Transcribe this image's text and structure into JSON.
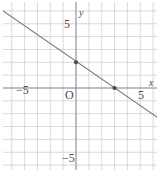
{
  "chart_data": {
    "type": "line",
    "title": "",
    "xlabel": "x",
    "ylabel": "y",
    "xlim": [
      -6,
      6.4
    ],
    "ylim": [
      -6.4,
      6.4
    ],
    "grid": true,
    "grid_step": 1,
    "legend": "none",
    "origin_label": "O",
    "x_tick_labels": [
      {
        "value": -5,
        "text": "−5"
      },
      {
        "value": 5,
        "text": "5"
      }
    ],
    "y_tick_labels": [
      {
        "value": 5,
        "text": "5"
      },
      {
        "value": -5,
        "text": "−5"
      }
    ],
    "series": [
      {
        "name": "line",
        "slope": -0.6667,
        "intercept": 2,
        "equation": "y = -2/3 x + 2",
        "x": [
          -6,
          6.4
        ],
        "y": [
          6,
          -2.27
        ]
      }
    ],
    "points": [
      {
        "x": 0,
        "y": 2,
        "label": ""
      },
      {
        "x": 3,
        "y": 0,
        "label": ""
      }
    ],
    "colors": {
      "grid": "#cfcfd4",
      "axis": "#8e8e96",
      "line": "#6b6b73",
      "point": "#4a4a52",
      "text": "#4a4a4a",
      "background": "#ffffff"
    }
  }
}
